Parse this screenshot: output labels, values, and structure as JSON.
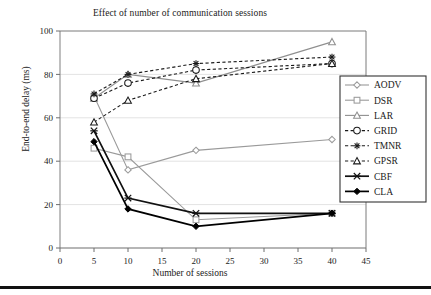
{
  "chart_data": {
    "type": "line",
    "title": "Effect of number of communication sessions",
    "xlabel": "Number of sessions",
    "ylabel": "End-to-end delay (ms)",
    "x": [
      5,
      10,
      20,
      40
    ],
    "xlim": [
      0,
      45
    ],
    "ylim": [
      0,
      100
    ],
    "xticks": [
      "0",
      "5",
      "10",
      "15",
      "20",
      "25",
      "30",
      "35",
      "40",
      "45"
    ],
    "yticks": [
      "0",
      "20",
      "40",
      "60",
      "80",
      "100"
    ],
    "grid": "horizontal",
    "legend_position": "right",
    "series": [
      {
        "name": "AODV",
        "values": [
          70,
          36,
          45,
          50
        ],
        "marker": "diamond-open",
        "line": "solid",
        "color": "#9a9a9a"
      },
      {
        "name": "DSR",
        "values": [
          46,
          42,
          13,
          16
        ],
        "marker": "square-open",
        "line": "solid",
        "color": "#9a9a9a"
      },
      {
        "name": "LAR",
        "values": [
          69,
          80,
          76,
          95
        ],
        "marker": "triangle-open",
        "line": "solid",
        "color": "#8f8f8f"
      },
      {
        "name": "GRID",
        "values": [
          69,
          76,
          82,
          85
        ],
        "marker": "circle-open",
        "line": "dashed",
        "color": "#1a1a1a"
      },
      {
        "name": "TMNR",
        "values": [
          71,
          80,
          85,
          88
        ],
        "marker": "asterisk",
        "line": "dashed",
        "color": "#1a1a1a"
      },
      {
        "name": "GPSR",
        "values": [
          58,
          68,
          78,
          85
        ],
        "marker": "triangle-open",
        "line": "dashed",
        "color": "#1a1a1a"
      },
      {
        "name": "CBF",
        "values": [
          54,
          23,
          16,
          16
        ],
        "marker": "cross-x",
        "line": "solid",
        "color": "#111111"
      },
      {
        "name": "CLA",
        "values": [
          49,
          18,
          10,
          16
        ],
        "marker": "diamond-fill",
        "line": "solid",
        "color": "#000000"
      }
    ]
  },
  "legend": {
    "items": [
      "AODV",
      "DSR",
      "LAR",
      "GRID",
      "TMNR",
      "GPSR",
      "CBF",
      "CLA"
    ]
  }
}
